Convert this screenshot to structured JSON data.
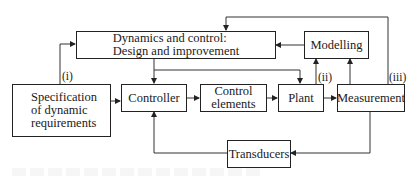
{
  "diagram": {
    "type": "block-flow",
    "nodes": {
      "dynamics": {
        "line1": "Dynamics and control:",
        "line2": "Design and improvement"
      },
      "modelling": {
        "label": "Modelling"
      },
      "specification": {
        "line1": "Specification",
        "line2": "of dynamic",
        "line3": "requirements"
      },
      "controller": {
        "label": "Controller"
      },
      "control_elements": {
        "line1": "Control",
        "line2": "elements"
      },
      "plant": {
        "label": "Plant"
      },
      "measurement": {
        "label": "Measurement"
      },
      "transducers": {
        "label": "Transducers"
      }
    },
    "path_labels": {
      "i": "(i)",
      "ii": "(ii)",
      "iii": "(iii)"
    },
    "edges": [
      {
        "from": "specification",
        "to": "dynamics",
        "label": "(i)"
      },
      {
        "from": "specification",
        "to": "controller"
      },
      {
        "from": "dynamics",
        "to": "controller"
      },
      {
        "from": "dynamics",
        "to": "plant"
      },
      {
        "from": "controller",
        "to": "control_elements"
      },
      {
        "from": "control_elements",
        "to": "plant"
      },
      {
        "from": "plant",
        "to": "measurement"
      },
      {
        "from": "plant",
        "to": "modelling",
        "label": "(ii)"
      },
      {
        "from": "measurement",
        "to": "modelling"
      },
      {
        "from": "modelling",
        "to": "dynamics"
      },
      {
        "from": "measurement",
        "to": "dynamics",
        "label": "(iii)"
      },
      {
        "from": "measurement",
        "to": "transducers"
      },
      {
        "from": "transducers",
        "to": "controller"
      }
    ],
    "colors": {
      "line": "#222222",
      "feedback_line": "#555555",
      "background": "#ffffff"
    }
  }
}
